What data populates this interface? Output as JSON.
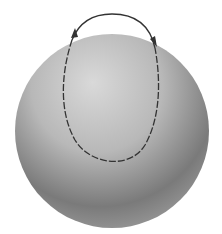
{
  "diagram": {
    "sphere": {
      "cx": 112,
      "cy": 131,
      "r": 97,
      "highlight": "#d6d6d6",
      "shadow": "#5a5a5a"
    },
    "loop": {
      "color": "#3a3a3a",
      "dashed_on_surface": true,
      "arrows": [
        "left-ascending",
        "right-descending"
      ]
    }
  }
}
